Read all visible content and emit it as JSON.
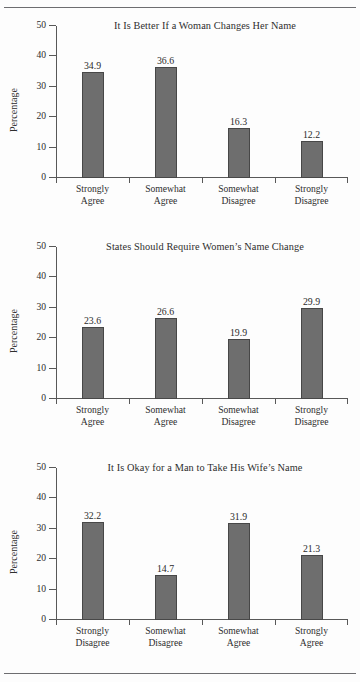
{
  "page": {
    "top_rule": "horizontal-rule",
    "bottom_rule": "horizontal-rule"
  },
  "chart_data": [
    {
      "type": "bar",
      "title": "It Is Better If a Woman Changes Her Name",
      "xlabel": "",
      "ylabel": "Percentage",
      "ylim": [
        0,
        50
      ],
      "yticks": [
        0,
        10,
        20,
        30,
        40,
        50
      ],
      "grid": false,
      "legend": "none",
      "bar_color": "#6e6e6e",
      "categories": [
        "Strongly Agree",
        "Somewhat Agree",
        "Somewhat Disagree",
        "Strongly Disagree"
      ],
      "category_lines": [
        [
          "Strongly",
          "Agree"
        ],
        [
          "Somewhat",
          "Agree"
        ],
        [
          "Somewhat",
          "Disagree"
        ],
        [
          "Strongly",
          "Disagree"
        ]
      ],
      "values": [
        34.9,
        36.6,
        16.3,
        12.2
      ],
      "value_labels": [
        "34.9",
        "36.6",
        "16.3",
        "12.2"
      ]
    },
    {
      "type": "bar",
      "title": "States Should Require Women’s Name Change",
      "xlabel": "",
      "ylabel": "Percentage",
      "ylim": [
        0,
        50
      ],
      "yticks": [
        0,
        10,
        20,
        30,
        40,
        50
      ],
      "grid": false,
      "legend": "none",
      "bar_color": "#6e6e6e",
      "categories": [
        "Strongly Agree",
        "Somewhat Agree",
        "Somewhat Disagree",
        "Strongly Disagree"
      ],
      "category_lines": [
        [
          "Strongly",
          "Agree"
        ],
        [
          "Somewhat",
          "Agree"
        ],
        [
          "Somewhat",
          "Disagree"
        ],
        [
          "Strongly",
          "Disagree"
        ]
      ],
      "values": [
        23.6,
        26.6,
        19.9,
        29.9
      ],
      "value_labels": [
        "23.6",
        "26.6",
        "19.9",
        "29.9"
      ]
    },
    {
      "type": "bar",
      "title": "It Is Okay for a Man to Take His Wife’s Name",
      "xlabel": "",
      "ylabel": "Percentage",
      "ylim": [
        0,
        50
      ],
      "yticks": [
        0,
        10,
        20,
        30,
        40,
        50
      ],
      "grid": false,
      "legend": "none",
      "bar_color": "#6e6e6e",
      "categories": [
        "Strongly Disagree",
        "Somewhat Disagree",
        "Somewhat Agree",
        "Strongly Agree"
      ],
      "category_lines": [
        [
          "Strongly",
          "Disagree"
        ],
        [
          "Somewhat",
          "Disagree"
        ],
        [
          "Somewhat",
          "Agree"
        ],
        [
          "Strongly",
          "Agree"
        ]
      ],
      "values": [
        32.2,
        14.7,
        31.9,
        21.3
      ],
      "value_labels": [
        "32.2",
        "14.7",
        "31.9",
        "21.3"
      ]
    }
  ]
}
